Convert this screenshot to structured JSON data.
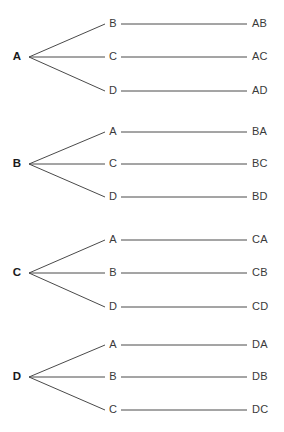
{
  "diagram": {
    "type": "tree-diagram",
    "colors": {
      "background": "#ffffff",
      "line": "#4a4a4a",
      "root_text": "#1a1a1a",
      "node_text": "#3a3a3a",
      "leaf_text": "#3a3a3a"
    },
    "geometry": {
      "width": 284,
      "height": 432,
      "root_x": 16,
      "fan_vertex_x": 29,
      "mid_node_x": 113,
      "mid_line_start_x": 121,
      "leaf_line_end_x": 247,
      "leaf_label_x": 252,
      "line_width": 1
    },
    "groups": [
      {
        "id": "group-a",
        "root": "A",
        "root_y": 57,
        "branches": [
          {
            "node": "B",
            "leaf": "AB",
            "y": 24
          },
          {
            "node": "C",
            "leaf": "AC",
            "y": 57
          },
          {
            "node": "D",
            "leaf": "AD",
            "y": 91
          }
        ]
      },
      {
        "id": "group-b",
        "root": "B",
        "root_y": 164,
        "branches": [
          {
            "node": "A",
            "leaf": "BA",
            "y": 132
          },
          {
            "node": "C",
            "leaf": "BC",
            "y": 164
          },
          {
            "node": "D",
            "leaf": "BD",
            "y": 197
          }
        ]
      },
      {
        "id": "group-c",
        "root": "C",
        "root_y": 273,
        "branches": [
          {
            "node": "A",
            "leaf": "CA",
            "y": 240
          },
          {
            "node": "B",
            "leaf": "CB",
            "y": 273
          },
          {
            "node": "D",
            "leaf": "CD",
            "y": 307
          }
        ]
      },
      {
        "id": "group-d",
        "root": "D",
        "root_y": 377,
        "branches": [
          {
            "node": "A",
            "leaf": "DA",
            "y": 345
          },
          {
            "node": "B",
            "leaf": "DB",
            "y": 377
          },
          {
            "node": "C",
            "leaf": "DC",
            "y": 410
          }
        ]
      }
    ]
  }
}
